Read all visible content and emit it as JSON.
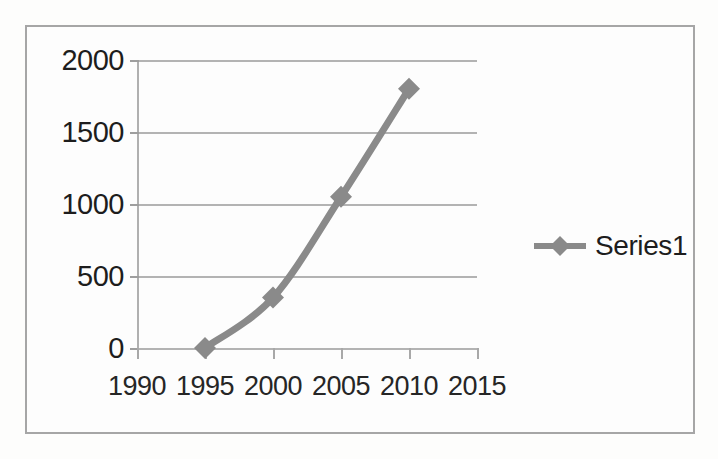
{
  "chart_data": {
    "type": "line",
    "title": "",
    "xlabel": "",
    "ylabel": "",
    "x": [
      1995,
      2000,
      2005,
      2010
    ],
    "series": [
      {
        "name": "Series1",
        "values": [
          0,
          350,
          1050,
          1800
        ]
      }
    ],
    "xlim": [
      1990,
      2015
    ],
    "ylim": [
      0,
      2000
    ],
    "x_ticks": [
      1990,
      1995,
      2000,
      2005,
      2010,
      2015
    ],
    "y_ticks": [
      0,
      500,
      1000,
      1500,
      2000
    ],
    "x_tick_labels": [
      "1990",
      "1995",
      "2000",
      "2005",
      "2010",
      "2015"
    ],
    "y_tick_labels": [
      "0",
      "500",
      "1000",
      "1500",
      "2000"
    ],
    "grid": true,
    "grid_axis": "y",
    "legend": true,
    "legend_position": "right",
    "marker": "diamond",
    "colors": {
      "series1": "#8a8a8a",
      "gridline": "#b3b3b3",
      "axis": "#a8a8a8",
      "tick_text": "#1d1d1d",
      "frame_border": "#a6a6a6",
      "background": "#fdfdfd"
    }
  },
  "legend": {
    "entries": [
      {
        "label": "Series1",
        "marker": "diamond-marker-icon"
      }
    ]
  }
}
